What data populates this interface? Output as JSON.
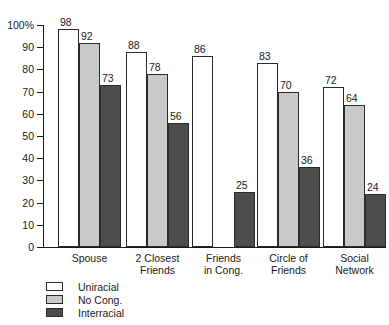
{
  "chart_data": {
    "type": "bar",
    "title": "",
    "subtitle": "",
    "xlabel": "",
    "ylabel": "",
    "ylim": [
      0,
      100
    ],
    "grid": false,
    "legend_position": "bottom-left",
    "categories": [
      "Spouse",
      "2 Closest Friends",
      "Friends in Cong.",
      "Circle of Friends",
      "Social Network"
    ],
    "category_lines": [
      [
        "Spouse"
      ],
      [
        "2 Closest",
        "Friends"
      ],
      [
        "Friends",
        "in Cong."
      ],
      [
        "Circle of",
        "Friends"
      ],
      [
        "Social",
        "Network"
      ]
    ],
    "ytick_labels": [
      "0",
      "10",
      "20",
      "30",
      "40",
      "50",
      "60",
      "70",
      "80",
      "90",
      "100%"
    ],
    "ytick_values": [
      0,
      10,
      20,
      30,
      40,
      50,
      60,
      70,
      80,
      90,
      100
    ],
    "series": [
      {
        "name": "Uniracial",
        "color": "#ffffff",
        "values": [
          98,
          88,
          86,
          83,
          72
        ]
      },
      {
        "name": "No Cong.",
        "color": "#c9c9c9",
        "values": [
          92,
          78,
          null,
          70,
          64
        ]
      },
      {
        "name": "Interracial",
        "color": "#4d4d4d",
        "values": [
          73,
          56,
          25,
          36,
          24
        ]
      }
    ]
  },
  "legend": {
    "items": [
      {
        "label": "Uniracial",
        "swatch": "#ffffff"
      },
      {
        "label": "No Cong.",
        "swatch": "#c9c9c9"
      },
      {
        "label": "Interracial",
        "swatch": "#4d4d4d"
      }
    ]
  },
  "colors": {
    "axis": "#1a1a1a",
    "bar_outline": "#2b2b2b",
    "uniracial": "#ffffff",
    "nocong": "#c9c9c9",
    "interracial": "#4d4d4d",
    "background": "#ffffff"
  }
}
